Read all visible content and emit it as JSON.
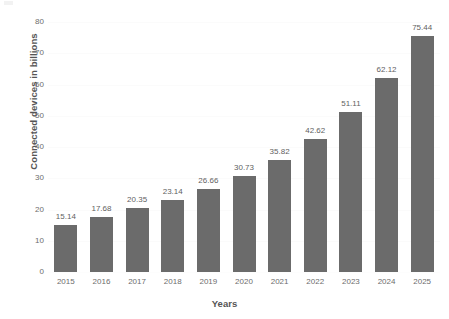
{
  "chart_data": {
    "type": "bar",
    "title": "",
    "xlabel": "Years",
    "ylabel": "Connected devices in billions",
    "categories": [
      "2015",
      "2016",
      "2017",
      "2018",
      "2019",
      "2020",
      "2021",
      "2022",
      "2023",
      "2024",
      "2025"
    ],
    "values": [
      15.14,
      17.68,
      20.35,
      23.14,
      26.66,
      30.73,
      35.82,
      42.62,
      51.11,
      62.12,
      75.44
    ],
    "value_labels": [
      "15.14",
      "17.68",
      "20.35",
      "23.14",
      "26.66",
      "30.73",
      "35.82",
      "42.62",
      "51.11",
      "62.12",
      "75.44"
    ],
    "ylim": [
      0,
      80
    ],
    "yticks": [
      0,
      10,
      20,
      30,
      40,
      50,
      60,
      70,
      80
    ],
    "ytick_labels": [
      "0",
      "10",
      "20",
      "30",
      "40",
      "50",
      "60",
      "70",
      "80"
    ],
    "grid": true,
    "legend": "none",
    "bar_color": "#6b6b6b",
    "background_color": "#ffffff",
    "text_color": "#6d6d6d",
    "axis_title_color": "#555555"
  }
}
